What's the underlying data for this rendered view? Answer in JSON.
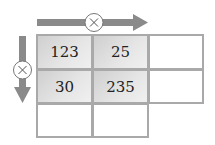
{
  "diagram": {
    "type": "multiplication-grid",
    "top_operator": {
      "symbol": "×",
      "direction": "right"
    },
    "left_operator": {
      "symbol": "×",
      "direction": "down"
    },
    "grid": {
      "rows": [
        [
          "123",
          "25",
          ""
        ],
        [
          "30",
          "235",
          ""
        ],
        [
          "",
          ""
        ]
      ]
    },
    "colors": {
      "arrow": "#8a8a8a",
      "cell_border": "#a9a9a9",
      "filled_cell": "#d9d9d9"
    }
  }
}
